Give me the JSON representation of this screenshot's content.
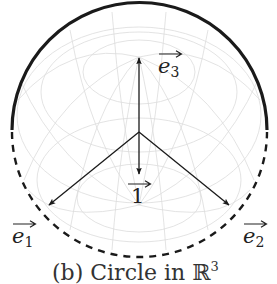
{
  "figure": {
    "caption": {
      "prefix": "(b) Circle in ",
      "space": "ℝ",
      "exponent": "3"
    },
    "vectors": {
      "e3": {
        "base": "e",
        "index": "3"
      },
      "one": {
        "base": "1"
      },
      "e1": {
        "base": "e",
        "index": "1"
      },
      "e2": {
        "base": "e",
        "index": "2"
      }
    },
    "circle": {
      "upper_arc_style": "solid",
      "lower_arc_style": "dashed"
    },
    "colors": {
      "ink": "#1a1a1a",
      "grid": "#d9d9d9"
    }
  }
}
